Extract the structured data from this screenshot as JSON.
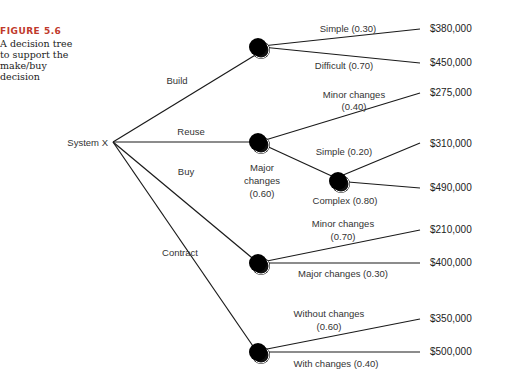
{
  "caption": {
    "figure_label": "FIGURE 5.6",
    "description": "A decision tree to support the make/buy decision"
  },
  "root": {
    "label": "System X"
  },
  "branches": [
    {
      "label": "Build"
    },
    {
      "label": "Reuse"
    },
    {
      "label": "Buy"
    },
    {
      "label": "Contract"
    }
  ],
  "outcomes": {
    "build_simple": {
      "label": "Simple (0.30)",
      "value": "$380,000"
    },
    "build_difficult": {
      "label": "Difficult (0.70)",
      "value": "$450,000"
    },
    "reuse_minor": {
      "label_line1": "Minor changes",
      "label_line2": "(0.40)",
      "value": "$275,000"
    },
    "reuse_major": {
      "label_line1": "Major",
      "label_line2": "changes",
      "label_line3": "(0.60)"
    },
    "reuse_major_simple": {
      "label": "Simple (0.20)",
      "value": "$310,000"
    },
    "reuse_major_complex": {
      "label": "Complex (0.80)",
      "value": "$490,000"
    },
    "buy_minor": {
      "label_line1": "Minor changes",
      "label_line2": "(0.70)",
      "value": "$210,000"
    },
    "buy_major": {
      "label": "Major changes (0.30)",
      "value": "$400,000"
    },
    "contract_without": {
      "label_line1": "Without changes",
      "label_line2": "(0.60)",
      "value": "$350,000"
    },
    "contract_with": {
      "label": "With changes (0.40)",
      "value": "$500,000"
    }
  }
}
